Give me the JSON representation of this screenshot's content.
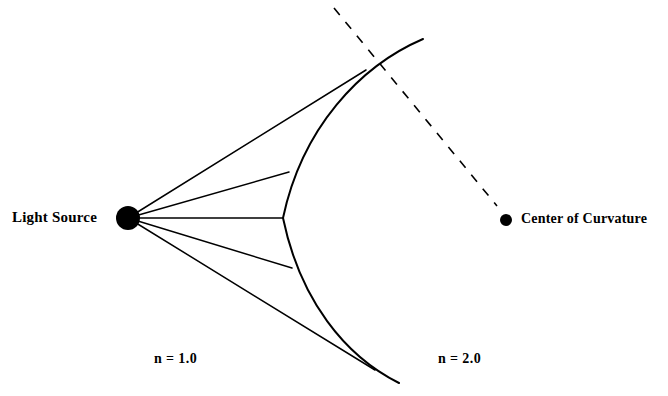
{
  "figure": {
    "type": "optics-refraction-diagram",
    "width": 668,
    "height": 396,
    "background_color": "#ffffff",
    "stroke_color": "#000000"
  },
  "labels": {
    "light_source": "Light Source",
    "center_of_curvature": "Center of Curvature",
    "index_left": "n = 1.0",
    "index_right": "n = 2.0"
  },
  "points": {
    "light_source": {
      "x": 128,
      "y": 218,
      "radius": 12,
      "fill": "#000000"
    },
    "center_of_curvature": {
      "x": 506,
      "y": 220,
      "radius": 6,
      "fill": "#000000"
    }
  },
  "surface": {
    "name": "spherical-refracting-surface",
    "vertex": {
      "x": 283,
      "y": 218
    },
    "top_end": {
      "x": 423,
      "y": 39
    },
    "bottom_end": {
      "x": 399,
      "y": 383
    },
    "path": "M 423 39 C 360 66 302 128 283 218 C 300 300 345 356 399 383",
    "stroke_width": 2
  },
  "axis": {
    "name": "optical-axis-dashed",
    "from": {
      "x": 334,
      "y": 8
    },
    "to": {
      "x": 497,
      "y": 206
    },
    "dash_pattern": "9 9",
    "stroke_width": 1.6
  },
  "rays": [
    {
      "name": "ray-1-upper-outer",
      "from": {
        "x": 128,
        "y": 218
      },
      "to": {
        "x": 366,
        "y": 70
      }
    },
    {
      "name": "ray-2-upper-inner",
      "from": {
        "x": 128,
        "y": 218
      },
      "to": {
        "x": 289,
        "y": 172
      }
    },
    {
      "name": "ray-3-axial",
      "from": {
        "x": 128,
        "y": 218
      },
      "to": {
        "x": 283,
        "y": 218
      }
    },
    {
      "name": "ray-4-lower-inner",
      "from": {
        "x": 128,
        "y": 218
      },
      "to": {
        "x": 292,
        "y": 268
      }
    },
    {
      "name": "ray-5-lower-outer",
      "from": {
        "x": 128,
        "y": 218
      },
      "to": {
        "x": 375,
        "y": 370
      }
    }
  ],
  "media": {
    "left_region_index": "1.0",
    "right_region_index": "2.0"
  }
}
